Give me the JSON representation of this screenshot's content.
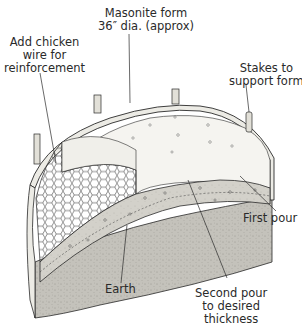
{
  "diagram": {
    "type": "illustration",
    "colors": {
      "line": "#2a2a2a",
      "form": "#e8e6df",
      "concrete_top": "#f4f3ef",
      "concrete_section": "#cfcdc6",
      "earth": "#bdbbb4"
    },
    "labels": {
      "masonite": {
        "line1": "Masonite form",
        "line2": "36″ dia. (approx)"
      },
      "chicken_wire": {
        "line1": "Add chicken",
        "line2": "wire for",
        "line3": "reinforcement"
      },
      "stakes": {
        "line1": "Stakes to",
        "line2": "support form"
      },
      "first_pour": {
        "line1": "First pour"
      },
      "earth": {
        "line1": "Earth"
      },
      "second_pour": {
        "line1": "Second pour",
        "line2": "to desired",
        "line3": "thickness"
      }
    }
  }
}
